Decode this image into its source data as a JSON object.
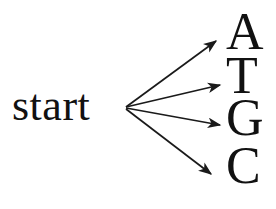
{
  "diagram": {
    "background_color": "#ffffff",
    "stroke_color": "#1a1a1a",
    "text_color": "#111111",
    "start": {
      "label": "start",
      "x": 125,
      "y": 108
    },
    "bases": [
      {
        "id": "a",
        "label": "A",
        "arrow_end_x": 218,
        "arrow_end_y": 40
      },
      {
        "id": "t",
        "label": "T",
        "arrow_end_x": 222,
        "arrow_end_y": 84
      },
      {
        "id": "g",
        "label": "G",
        "arrow_end_x": 222,
        "arrow_end_y": 125
      },
      {
        "id": "c",
        "label": "C",
        "arrow_end_x": 213,
        "arrow_end_y": 176
      }
    ]
  }
}
